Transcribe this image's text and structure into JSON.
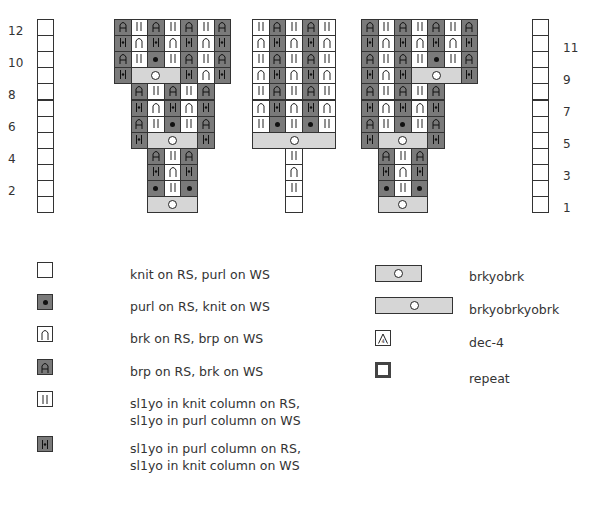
{
  "row_numbers_left": [
    "12",
    "10",
    "8",
    "6",
    "4",
    "2"
  ],
  "row_numbers_right": [
    "11",
    "9",
    "7",
    "5",
    "3",
    "1"
  ],
  "colors": {
    "dark_cell": "#7a7a7a",
    "light_cell": "#d6d6d6",
    "white_cell": "#ffffff",
    "grid_line": "#333333"
  },
  "symbols": {
    "knit": "blank",
    "purl": "dot",
    "brk": "arch",
    "brp": "A-glyph",
    "sl1yo_knit": "double-bar",
    "sl1yo_purl": "bar-dot-bar",
    "brkyobrk": "circle",
    "dec4": "triangle-4",
    "repeat": "thick-border-box"
  },
  "chart_data": {
    "type": "table",
    "title": "",
    "charts": [
      {
        "name": "chart-left",
        "columns": 7,
        "rows": [
          {
            "row": 12,
            "cells": [
              "brp",
              "sl1yo_knit",
              "brp",
              "sl1yo_knit",
              "brp",
              "sl1yo_knit",
              "brp"
            ]
          },
          {
            "row": 11,
            "cells": [
              "sl1yo_purl",
              "brk",
              "sl1yo_purl",
              "brk",
              "sl1yo_purl",
              "brk",
              "sl1yo_purl"
            ]
          },
          {
            "row": 10,
            "cells": [
              "brp",
              "sl1yo_knit",
              "purl",
              "sl1yo_knit",
              "brp",
              "sl1yo_knit",
              "brp"
            ]
          },
          {
            "row": 9,
            "cells": [
              "sl1yo_purl",
              "brkyobrk:3",
              "sl1yo_purl",
              "brk",
              "sl1yo_purl"
            ]
          },
          {
            "row": 8,
            "offset": 1,
            "cells": [
              "brp",
              "sl1yo_knit",
              "brp",
              "sl1yo_knit",
              "brp"
            ]
          },
          {
            "row": 7,
            "offset": 1,
            "cells": [
              "sl1yo_purl",
              "brk",
              "sl1yo_purl",
              "brk",
              "sl1yo_purl"
            ]
          },
          {
            "row": 6,
            "offset": 1,
            "cells": [
              "brp",
              "sl1yo_knit",
              "purl",
              "sl1yo_knit",
              "brp"
            ]
          },
          {
            "row": 5,
            "offset": 1,
            "cells": [
              "sl1yo_purl",
              "brkyobrk:3",
              "sl1yo_purl"
            ]
          },
          {
            "row": 4,
            "offset": 2,
            "cells": [
              "brp",
              "sl1yo_knit",
              "brp"
            ]
          },
          {
            "row": 3,
            "offset": 2,
            "cells": [
              "sl1yo_purl",
              "brk",
              "sl1yo_purl"
            ]
          },
          {
            "row": 2,
            "offset": 2,
            "cells": [
              "purl",
              "sl1yo_knit",
              "purl"
            ]
          },
          {
            "row": 1,
            "offset": 2,
            "cells": [
              "brkyobrk:3"
            ]
          }
        ]
      },
      {
        "name": "chart-middle",
        "columns": 5,
        "rows": [
          {
            "row": 12,
            "cells": [
              "sl1yo_knit",
              "brp",
              "sl1yo_knit",
              "brp",
              "sl1yo_knit"
            ]
          },
          {
            "row": 11,
            "cells": [
              "brk",
              "sl1yo_purl",
              "brk",
              "sl1yo_purl",
              "brk"
            ]
          },
          {
            "row": 10,
            "cells": [
              "sl1yo_knit",
              "brp",
              "sl1yo_knit",
              "brp",
              "sl1yo_knit"
            ]
          },
          {
            "row": 9,
            "cells": [
              "brk",
              "sl1yo_purl",
              "brk",
              "sl1yo_purl",
              "brk"
            ]
          },
          {
            "row": 8,
            "cells": [
              "sl1yo_knit",
              "brp",
              "sl1yo_knit",
              "brp",
              "sl1yo_knit"
            ]
          },
          {
            "row": 7,
            "cells": [
              "brk",
              "sl1yo_purl",
              "brk",
              "sl1yo_purl",
              "brk"
            ]
          },
          {
            "row": 6,
            "cells": [
              "sl1yo_knit",
              "purl",
              "sl1yo_knit",
              "purl",
              "sl1yo_knit"
            ]
          },
          {
            "row": 5,
            "cells": [
              "brkyobrkyobrk:5"
            ]
          },
          {
            "row": 4,
            "offset": 2,
            "cells": [
              "sl1yo_knit"
            ]
          },
          {
            "row": 3,
            "offset": 2,
            "cells": [
              "brk"
            ]
          },
          {
            "row": 2,
            "offset": 2,
            "cells": [
              "sl1yo_knit"
            ]
          },
          {
            "row": 1,
            "offset": 2,
            "cells": [
              "knit"
            ]
          }
        ]
      },
      {
        "name": "chart-right",
        "columns": 7,
        "rows": [
          {
            "row": 12,
            "cells": [
              "brp",
              "sl1yo_knit",
              "brp",
              "sl1yo_knit",
              "brp",
              "sl1yo_knit",
              "brp"
            ]
          },
          {
            "row": 11,
            "cells": [
              "sl1yo_purl",
              "brk",
              "sl1yo_purl",
              "brk",
              "sl1yo_purl",
              "brk",
              "sl1yo_purl"
            ]
          },
          {
            "row": 10,
            "cells": [
              "brp",
              "sl1yo_knit",
              "brp",
              "sl1yo_knit",
              "purl",
              "sl1yo_knit",
              "brp"
            ]
          },
          {
            "row": 9,
            "cells": [
              "sl1yo_purl",
              "brk",
              "sl1yo_purl",
              "brkyobrk:3",
              "sl1yo_purl"
            ]
          },
          {
            "row": 8,
            "cells": [
              "brp",
              "sl1yo_knit",
              "brp",
              "sl1yo_knit",
              "brp"
            ]
          },
          {
            "row": 7,
            "cells": [
              "sl1yo_purl",
              "brk",
              "sl1yo_purl",
              "brk",
              "sl1yo_purl"
            ]
          },
          {
            "row": 6,
            "cells": [
              "brp",
              "sl1yo_knit",
              "purl",
              "sl1yo_knit",
              "brp"
            ]
          },
          {
            "row": 5,
            "cells": [
              "sl1yo_purl",
              "brkyobrk:3",
              "sl1yo_purl"
            ]
          },
          {
            "row": 4,
            "offset": 1,
            "cells": [
              "brp",
              "sl1yo_knit",
              "brp"
            ]
          },
          {
            "row": 3,
            "offset": 1,
            "cells": [
              "sl1yo_purl",
              "brk",
              "sl1yo_purl"
            ]
          },
          {
            "row": 2,
            "offset": 1,
            "cells": [
              "purl",
              "sl1yo_knit",
              "purl"
            ]
          },
          {
            "row": 1,
            "offset": 1,
            "cells": [
              "brkyobrk:3"
            ]
          }
        ]
      }
    ]
  },
  "legend": {
    "left": [
      {
        "key": "knit",
        "label": "knit on RS, purl on WS"
      },
      {
        "key": "purl",
        "label": "purl on RS, knit on WS"
      },
      {
        "key": "brk",
        "label": "brk on RS, brp on WS"
      },
      {
        "key": "brp",
        "label": "brp on RS, brk on WS"
      },
      {
        "key": "sl1yo_knit",
        "label_line1": "sl1yo in knit column on RS,",
        "label_line2": "sl1yo in purl column on WS"
      },
      {
        "key": "sl1yo_purl",
        "label_line1": "sl1yo in purl column on RS,",
        "label_line2": "sl1yo in knit column on WS"
      }
    ],
    "right": [
      {
        "key": "brkyobrk",
        "label": "brkyobrk"
      },
      {
        "key": "brkyobrkyobrk",
        "label": "brkyobrkyobrk"
      },
      {
        "key": "dec4",
        "label": "dec-4"
      },
      {
        "key": "repeat",
        "label": "repeat"
      }
    ]
  }
}
